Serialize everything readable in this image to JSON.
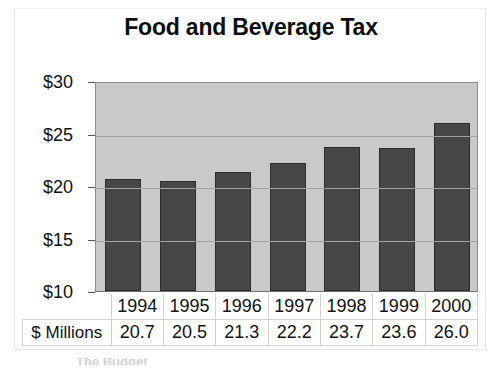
{
  "chart_data": {
    "type": "bar",
    "title": "Food and Beverage Tax",
    "xlabel": "",
    "ylabel": "",
    "categories": [
      "1994",
      "1995",
      "1996",
      "1997",
      "1998",
      "1999",
      "2000"
    ],
    "values": [
      20.7,
      20.5,
      21.3,
      22.2,
      23.7,
      23.6,
      26.0
    ],
    "ylim": [
      10,
      30
    ],
    "ytick_values": [
      10,
      15,
      20,
      25,
      30
    ],
    "ytick_labels": [
      "$10",
      "$15",
      "$20",
      "$25",
      "$30"
    ],
    "grid": true,
    "legend": "none",
    "series": [
      {
        "name": "$ Millions",
        "values": [
          20.7,
          20.5,
          21.3,
          22.2,
          23.7,
          23.6,
          26.0
        ]
      }
    ],
    "data_table": {
      "row_label": "$ Millions",
      "columns": [
        "1994",
        "1995",
        "1996",
        "1997",
        "1998",
        "1999",
        "2000"
      ],
      "cells": [
        "20.7",
        "20.5",
        "21.3",
        "22.2",
        "23.7",
        "23.6",
        "26.0"
      ]
    },
    "colors": {
      "bar_fill": "#474747",
      "bar_border": "#2b2b2b",
      "plot_background": "#c9c9c9",
      "gridline": "#a2a2a2",
      "text": "#111111",
      "page_background": "#ffffff"
    }
  }
}
